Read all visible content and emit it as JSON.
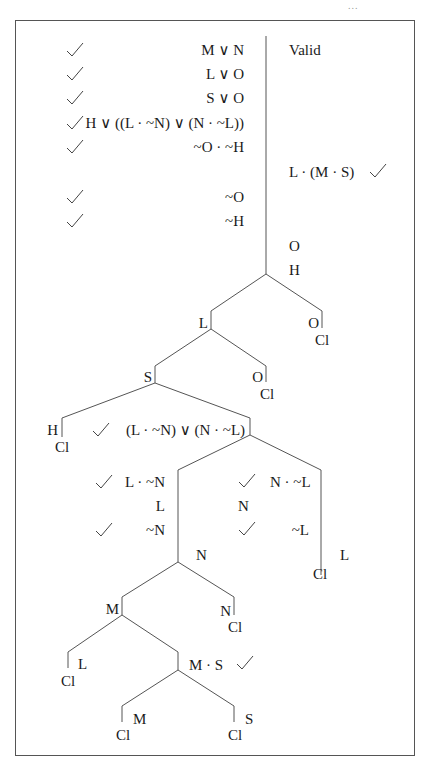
{
  "page_marker": "...",
  "tree": {
    "verdict": "Valid",
    "premises": [
      {
        "text": "M ∨ N",
        "checked": true
      },
      {
        "text": "L ∨ O",
        "checked": true
      },
      {
        "text": "S ∨ O",
        "checked": true
      },
      {
        "text": "H ∨ ((L · ~N) ∨ (N · ~L))",
        "checked": true
      },
      {
        "text": "~O · ~H",
        "checked": true
      }
    ],
    "negated_conclusion": {
      "text": "L · (M · S)",
      "checked": true
    },
    "derived_left": [
      {
        "text": "~O",
        "checked": true
      },
      {
        "text": "~H",
        "checked": true
      }
    ],
    "trunk_right": [
      "O",
      "H"
    ],
    "nodes": {
      "l1_left": "L",
      "l1_right": "O",
      "l1_right_close": "Cl",
      "l2_left": "S",
      "l2_right": "O",
      "l2_right_close": "Cl",
      "l3_left": "H",
      "l3_left_close": "Cl",
      "l3_right": {
        "text": "(L · ~N) ∨ (N · ~L)",
        "checked": true
      },
      "l4_left": [
        {
          "text": "L · ~N",
          "checked": true
        },
        {
          "text": "L",
          "checked": false
        },
        {
          "text": "~N",
          "checked": true
        }
      ],
      "l4_right": [
        {
          "text": "N · ~L",
          "checked": true
        },
        {
          "text": "N",
          "checked": false
        },
        {
          "text": "~L",
          "checked": true
        }
      ],
      "l4_left_extra": "N",
      "l4_right_extra": "L",
      "l4_right_close": "Cl",
      "l5_left": "M",
      "l5_right": "N",
      "l5_right_close": "Cl",
      "l6_left": "L",
      "l6_left_close": "Cl",
      "l6_right": {
        "text": "M · S",
        "checked": true
      },
      "l7_left": "M",
      "l7_left_close": "Cl",
      "l7_right": "S",
      "l7_right_close": "Cl"
    },
    "colors": {
      "line": "#555555",
      "text": "#1a1a1a",
      "border": "#555555"
    }
  }
}
